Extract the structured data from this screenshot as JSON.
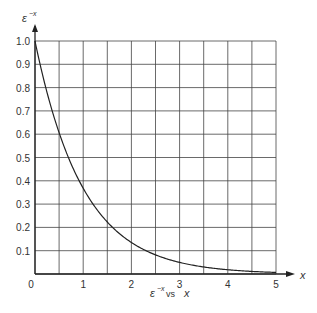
{
  "chart_data": {
    "type": "line",
    "title": "",
    "caption": {
      "base": "ε",
      "exp": "−x",
      "mid": " vs ",
      "var": "x"
    },
    "xlabel": "x",
    "ylabel": {
      "base": "ε",
      "exp": "−x"
    },
    "xlim": [
      0,
      5
    ],
    "ylim": [
      0,
      1.0
    ],
    "grid": true,
    "x_ticks": [
      "0",
      "1",
      "2",
      "3",
      "4",
      "5"
    ],
    "y_ticks": [
      "0.1",
      "0.2",
      "0.3",
      "0.4",
      "0.5",
      "0.6",
      "0.7",
      "0.8",
      "0.9",
      "1.0"
    ],
    "x_grid_step": 0.5,
    "y_grid_step": 0.1,
    "series": [
      {
        "name": "e^-x",
        "x": [
          0,
          0.25,
          0.5,
          0.75,
          1.0,
          1.25,
          1.5,
          1.75,
          2.0,
          2.5,
          3.0,
          3.5,
          4.0,
          4.5,
          5.0
        ],
        "values": [
          1.0,
          0.779,
          0.607,
          0.472,
          0.368,
          0.287,
          0.223,
          0.174,
          0.135,
          0.082,
          0.05,
          0.03,
          0.018,
          0.011,
          0.007
        ]
      }
    ]
  },
  "colors": {
    "line": "#222222",
    "grid": "#444444",
    "text": "#333333"
  }
}
